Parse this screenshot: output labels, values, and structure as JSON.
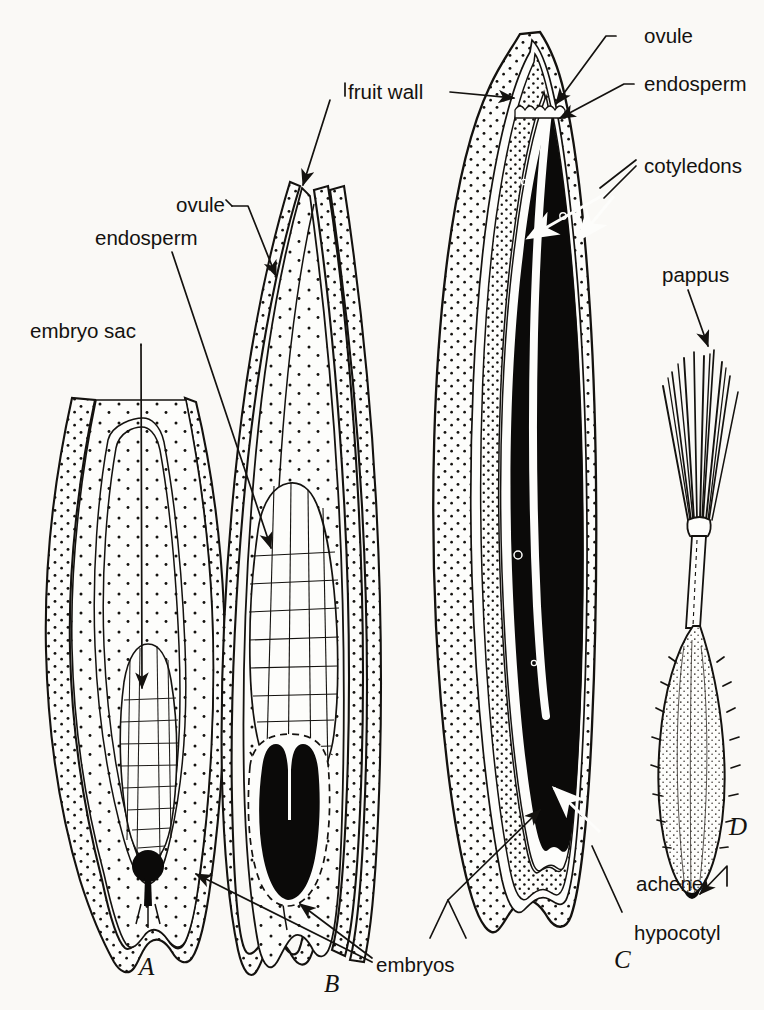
{
  "figure": {
    "background_color": "#faf9f6",
    "ink_color": "#14120f"
  },
  "panels": [
    {
      "id": "A",
      "label": "A",
      "caption": "ovule with embryo sac"
    },
    {
      "id": "B",
      "label": "B",
      "caption": "ovule with endosperm and young embryo"
    },
    {
      "id": "C",
      "label": "C",
      "caption": "mature achene in section"
    },
    {
      "id": "D",
      "label": "D",
      "caption": "entire achene with pappus"
    }
  ],
  "labels": {
    "embryo_sac": "embryo sac",
    "endosperm_left": "endosperm",
    "ovule_left": "ovule",
    "fruit_wall": "fruit wall",
    "ovule_right": "ovule",
    "endosperm_right": "endosperm",
    "cotyledons": "cotyledons",
    "pappus": "pappus",
    "achene": "achene",
    "hypocotyl": "hypocotyl",
    "embryos": "embryos"
  },
  "panel_labels": {
    "a": "A",
    "b": "B",
    "c": "C",
    "d": "D"
  },
  "colors": {
    "ink": "#14120f",
    "paper": "#faf9f6",
    "embryo_black": "#0b0a09",
    "tissue_white": "#fdfdfb"
  }
}
